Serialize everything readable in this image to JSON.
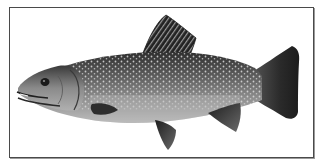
{
  "image": {
    "subject": "trout illustration",
    "style": "grayscale",
    "colors": {
      "frame_border": "#4a4a4a",
      "background": "#ffffff",
      "body_dark": "#3a3a3a",
      "body_mid": "#7a7a7a",
      "belly_light": "#c8c8c8",
      "spots": "#d8d8d8",
      "fin_dark": "#2a2a2a"
    }
  }
}
